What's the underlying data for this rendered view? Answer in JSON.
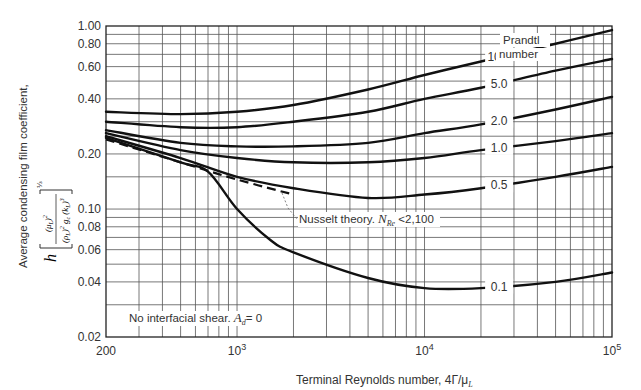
{
  "chart_data": {
    "type": "line",
    "title": "",
    "xlabel": "Terminal Reynolds number, 4Γ/μ_L",
    "ylabel": "Average condensing film coefficient, h [ (μ_L)^2 / ((ρ_L)^2 g_c (k_L)^3) ]^(1/3)",
    "xscale": "log",
    "yscale": "log",
    "xlim": [
      200,
      100000
    ],
    "ylim": [
      0.02,
      1.0
    ],
    "grid": true,
    "x_ticks": [
      {
        "value": 200,
        "label": "200"
      },
      {
        "value": 1000,
        "label": "10^3"
      },
      {
        "value": 10000,
        "label": "10^4"
      },
      {
        "value": 100000,
        "label": "10^5"
      }
    ],
    "y_ticks": [
      {
        "value": 1.0,
        "label": "1.00"
      },
      {
        "value": 0.8,
        "label": "0.80"
      },
      {
        "value": 0.6,
        "label": "0.60"
      },
      {
        "value": 0.4,
        "label": "0.40"
      },
      {
        "value": 0.2,
        "label": "0.20"
      },
      {
        "value": 0.1,
        "label": "0.10"
      },
      {
        "value": 0.08,
        "label": "0.08"
      },
      {
        "value": 0.06,
        "label": "0.06"
      },
      {
        "value": 0.04,
        "label": "0.04"
      },
      {
        "value": 0.02,
        "label": "0.02"
      }
    ],
    "legend_title": "Prandtl number",
    "series": [
      {
        "name": "10.0",
        "label": "10.0",
        "style": "solid",
        "x": [
          200,
          500,
          1000,
          2000,
          5000,
          10000,
          20000,
          50000,
          100000
        ],
        "y": [
          0.34,
          0.33,
          0.34,
          0.37,
          0.45,
          0.54,
          0.64,
          0.8,
          0.95
        ],
        "label_at": 25000
      },
      {
        "name": "5.0",
        "label": "5.0",
        "style": "solid",
        "x": [
          200,
          500,
          1000,
          2000,
          5000,
          10000,
          20000,
          50000,
          100000
        ],
        "y": [
          0.3,
          0.28,
          0.28,
          0.3,
          0.34,
          0.4,
          0.46,
          0.57,
          0.66
        ],
        "label_at": 25000
      },
      {
        "name": "2.0",
        "label": "2.0",
        "style": "solid",
        "x": [
          200,
          500,
          1000,
          2000,
          5000,
          10000,
          20000,
          50000,
          100000
        ],
        "y": [
          0.27,
          0.23,
          0.22,
          0.22,
          0.23,
          0.26,
          0.29,
          0.35,
          0.41
        ],
        "label_at": 25000
      },
      {
        "name": "1.0",
        "label": "1.0",
        "style": "solid",
        "x": [
          200,
          500,
          1000,
          2000,
          5000,
          10000,
          20000,
          50000,
          100000
        ],
        "y": [
          0.26,
          0.21,
          0.19,
          0.18,
          0.18,
          0.19,
          0.21,
          0.235,
          0.26
        ],
        "label_at": 25000
      },
      {
        "name": "0.5",
        "label": "0.5",
        "style": "solid",
        "x": [
          200,
          500,
          1000,
          2000,
          5000,
          10000,
          20000,
          50000,
          100000
        ],
        "y": [
          0.25,
          0.19,
          0.15,
          0.13,
          0.115,
          0.12,
          0.13,
          0.15,
          0.17
        ],
        "label_at": 25000
      },
      {
        "name": "0.1",
        "label": "0.1",
        "style": "solid",
        "x": [
          200,
          500,
          700,
          1000,
          1500,
          2000,
          5000,
          10000,
          20000,
          50000,
          100000
        ],
        "y": [
          0.245,
          0.18,
          0.16,
          0.1,
          0.068,
          0.058,
          0.042,
          0.037,
          0.037,
          0.04,
          0.045
        ],
        "label_at": 25000
      },
      {
        "name": "Nusselt theory",
        "label": "",
        "style": "dashed",
        "x": [
          200,
          500,
          1000,
          2000
        ],
        "y": [
          0.24,
          0.18,
          0.145,
          0.12
        ]
      }
    ],
    "annotations": [
      {
        "text": "Prandtl",
        "position": "upper-right"
      },
      {
        "text": "number",
        "position": "upper-right"
      },
      {
        "text": "Nusselt theory. N_Re < 2,100",
        "points_to": "dashed curve near Re=1800"
      },
      {
        "text": "No interfacial shear. A_d = 0",
        "position": "lower-left"
      }
    ]
  },
  "labels": {
    "y_axis_line1": "Average condensing film coefficient,",
    "y_axis_h": "h",
    "y_axis_exp": "⅓",
    "y_axis_num": "(μ",
    "y_axis_den": "(ρ",
    "x_axis_main": "Terminal Reynolds number, 4Γ/μ",
    "x_axis_sub": "L",
    "legend_title_1": "Prandtl",
    "legend_title_2": "number",
    "nusselt_main": "Nusselt theory. ",
    "nusselt_N": "N",
    "nusselt_sub": "Re",
    "nusselt_cond": " <2,100",
    "shear_main": "No interfacial shear. ",
    "shear_A": "A",
    "shear_sub": "d",
    "shear_eq": "= 0"
  }
}
